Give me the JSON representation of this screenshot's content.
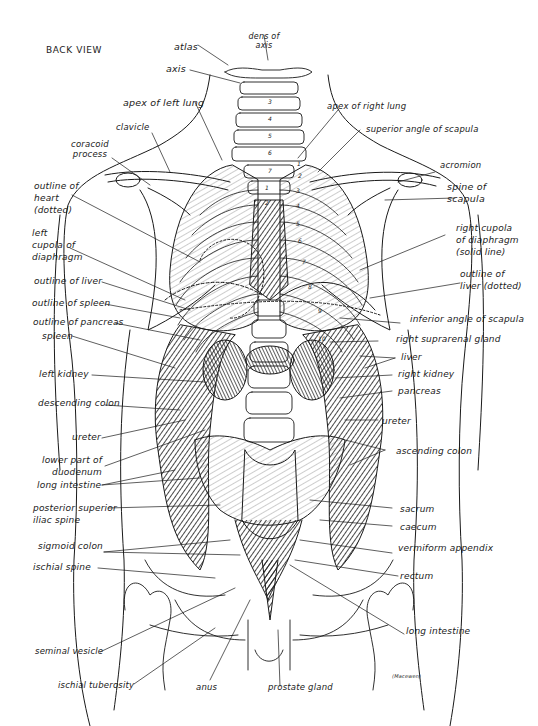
{
  "title": "BACK VIEW",
  "signature": "(Macewen)",
  "colors": {
    "ink": "#1a1a1a",
    "paper": "#ffffff",
    "shade": "#3a3a3a"
  },
  "vertebra_numbers": [
    "3",
    "4",
    "5",
    "6",
    "7",
    "1",
    "2"
  ],
  "rib_numbers": [
    "1",
    "2",
    "3",
    "4",
    "5",
    "6",
    "7",
    "8",
    "9",
    "10"
  ],
  "labels": {
    "atlas": "atlas",
    "dens_of_axis": "dens of\naxis",
    "axis": "axis",
    "apex_left_lung": "apex of left lung",
    "apex_right_lung": "apex of right lung",
    "superior_angle_scapula": "superior angle of scapula",
    "clavicle": "clavicle",
    "coracoid_process": "coracoid\nprocess",
    "acromion": "acromion",
    "spine_of_scapula": "spine of\nscapula",
    "outline_of_heart": "outline of\nheart\n(dotted)",
    "left_cupola": "left\ncupola of\ndiaphragm",
    "right_cupola": "right cupola\nof diaphragm\n(solid line)",
    "outline_of_liver_left": "outline of liver",
    "outline_of_liver_right": "outline of\nliver (dotted)",
    "outline_of_spleen": "outline of spleen",
    "inferior_angle_scapula": "inferior angle of scapula",
    "outline_of_pancreas": "outline of pancreas",
    "right_suprarenal_gland": "right suprarenal gland",
    "spleen": "spleen",
    "liver": "liver",
    "left_kidney": "left kidney",
    "right_kidney": "right kidney",
    "pancreas": "pancreas",
    "descending_colon": "descending colon",
    "ureter_left": "ureter",
    "ureter_right": "ureter",
    "lower_part_duodenum": "lower part of\nduodenum",
    "ascending_colon": "ascending colon",
    "long_intestine_left": "long intestine",
    "posterior_superior_iliac_spine": "posterior superior\niliac spine",
    "sacrum": "sacrum",
    "caecum": "caecum",
    "sigmoid_colon": "sigmoid colon",
    "vermiform_appendix": "vermiform appendix",
    "ischial_spine": "ischial spine",
    "rectum": "rectum",
    "long_intestine_right": "long intestine",
    "seminal_vesicle": "seminal vesicle",
    "ischial_tuberosity": "ischial tuberosity",
    "anus": "anus",
    "prostate_gland": "prostate gland"
  }
}
